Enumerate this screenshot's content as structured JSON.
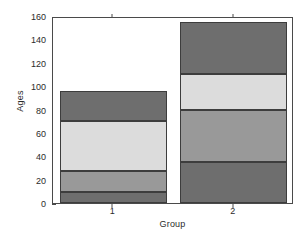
{
  "chart_data": {
    "type": "bar",
    "title": "",
    "subtitle": "",
    "xlabel": "Group",
    "ylabel": "Ages",
    "categories": [
      "1",
      "2"
    ],
    "stacked": true,
    "ylim": [
      0,
      160
    ],
    "yticks": [
      0,
      20,
      40,
      60,
      80,
      100,
      120,
      140,
      160
    ],
    "ytick_labels": [
      "0",
      "20",
      "40",
      "60",
      "80",
      "100",
      "120",
      "140",
      "160"
    ],
    "xticks": [
      1,
      2
    ],
    "xtick_labels": [
      "1",
      "2"
    ],
    "grid": false,
    "legend": "none",
    "series": [
      {
        "name": "segment-1",
        "color": "#6e6e6e",
        "values": [
          9,
          35
        ]
      },
      {
        "name": "segment-2",
        "color": "#999999",
        "values": [
          18,
          45
        ]
      },
      {
        "name": "segment-3",
        "color": "#dcdcdc",
        "values": [
          43,
          30
        ]
      },
      {
        "name": "segment-4",
        "color": "#6e6e6e",
        "values": [
          26,
          45
        ]
      }
    ],
    "cumulative_tops": {
      "1": [
        9,
        27,
        70,
        96
      ],
      "2": [
        35,
        80,
        110,
        155
      ]
    },
    "totals": [
      96,
      155
    ],
    "colors": {
      "axis": "#4a4a4a",
      "text": "#2b2b2b",
      "background": "#ffffff",
      "bar_edge": "#3d3d3d"
    }
  }
}
